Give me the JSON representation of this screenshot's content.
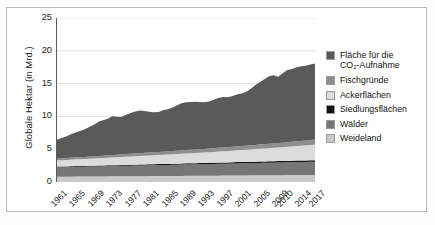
{
  "chart_data": {
    "type": "area",
    "stacked": true,
    "title": "",
    "subtitle": "",
    "xlabel": "",
    "ylabel": "Globale Hektar (in Mrd.)",
    "ylim": [
      0,
      25
    ],
    "ytick_values": [
      0,
      5,
      10,
      15,
      20,
      25
    ],
    "ytick_labels": [
      "0",
      "5",
      "10",
      "15",
      "20",
      "25"
    ],
    "xlim": [
      1961,
      2017
    ],
    "grid": true,
    "grid_axis": "y",
    "legend_position": "right",
    "x_tick_labels": [
      "1961",
      "1965",
      "1969",
      "1973",
      "1977",
      "1981",
      "1985",
      "1989",
      "1993",
      "1997",
      "2001",
      "2005",
      "2009",
      "2010",
      "2014",
      "2017"
    ],
    "x_tick_values": [
      1961,
      1965,
      1969,
      1973,
      1977,
      1981,
      1985,
      1989,
      1993,
      1997,
      2001,
      2005,
      2009,
      2010,
      2014,
      2017
    ],
    "x": [
      1961,
      1962,
      1963,
      1964,
      1965,
      1966,
      1967,
      1968,
      1969,
      1970,
      1971,
      1972,
      1973,
      1974,
      1975,
      1976,
      1977,
      1978,
      1979,
      1980,
      1981,
      1982,
      1983,
      1984,
      1985,
      1986,
      1987,
      1988,
      1989,
      1990,
      1991,
      1992,
      1993,
      1994,
      1995,
      1996,
      1997,
      1998,
      1999,
      2000,
      2001,
      2002,
      2003,
      2004,
      2005,
      2006,
      2007,
      2008,
      2009,
      2010,
      2011,
      2012,
      2013,
      2014,
      2015,
      2016,
      2017
    ],
    "stack_order_bottom_to_top": [
      "Weideland",
      "Wälder",
      "Siedlungsflächen",
      "Ackerflächen",
      "Fischgründe",
      "Fläche für die CO2-Aufnahme"
    ],
    "series": [
      {
        "name": "Fläche für die CO2-Aufnahme",
        "color": "#5a5a5a",
        "values": [
          2.9,
          3.1,
          3.3,
          3.6,
          3.8,
          4.0,
          4.2,
          4.5,
          4.8,
          5.2,
          5.4,
          5.6,
          5.9,
          5.8,
          5.7,
          6.0,
          6.2,
          6.4,
          6.5,
          6.4,
          6.2,
          6.1,
          6.1,
          6.3,
          6.4,
          6.6,
          6.9,
          7.2,
          7.3,
          7.3,
          7.3,
          7.2,
          7.1,
          7.2,
          7.4,
          7.6,
          7.7,
          7.6,
          7.7,
          7.9,
          8.0,
          8.2,
          8.6,
          9.1,
          9.5,
          9.9,
          10.3,
          10.4,
          10.1,
          10.6,
          11.0,
          11.1,
          11.3,
          11.4,
          11.4,
          11.5,
          11.6
        ]
      },
      {
        "name": "Fischgründe",
        "color": "#8e8e8e",
        "values": [
          0.25,
          0.26,
          0.27,
          0.28,
          0.29,
          0.3,
          0.31,
          0.32,
          0.33,
          0.34,
          0.35,
          0.35,
          0.36,
          0.37,
          0.38,
          0.39,
          0.4,
          0.41,
          0.42,
          0.43,
          0.44,
          0.45,
          0.46,
          0.47,
          0.48,
          0.49,
          0.5,
          0.51,
          0.52,
          0.52,
          0.53,
          0.53,
          0.54,
          0.55,
          0.56,
          0.57,
          0.58,
          0.58,
          0.59,
          0.6,
          0.6,
          0.61,
          0.62,
          0.63,
          0.64,
          0.65,
          0.66,
          0.67,
          0.68,
          0.69,
          0.7,
          0.71,
          0.72,
          0.73,
          0.74,
          0.75,
          0.76
        ]
      },
      {
        "name": "Ackerflächen",
        "color": "#dcdcdc",
        "values": [
          0.95,
          0.97,
          0.99,
          1.01,
          1.03,
          1.05,
          1.07,
          1.09,
          1.11,
          1.13,
          1.15,
          1.17,
          1.19,
          1.21,
          1.23,
          1.25,
          1.27,
          1.29,
          1.31,
          1.33,
          1.35,
          1.37,
          1.39,
          1.41,
          1.43,
          1.45,
          1.47,
          1.49,
          1.51,
          1.53,
          1.55,
          1.57,
          1.59,
          1.62,
          1.65,
          1.68,
          1.71,
          1.74,
          1.77,
          1.8,
          1.83,
          1.86,
          1.89,
          1.92,
          1.95,
          1.98,
          2.01,
          2.04,
          2.07,
          2.1,
          2.14,
          2.18,
          2.22,
          2.26,
          2.3,
          2.34,
          2.38
        ]
      },
      {
        "name": "Siedlungsflächen",
        "color": "#141414",
        "values": [
          0.1,
          0.1,
          0.1,
          0.11,
          0.11,
          0.11,
          0.11,
          0.12,
          0.12,
          0.12,
          0.12,
          0.13,
          0.13,
          0.13,
          0.13,
          0.14,
          0.14,
          0.14,
          0.14,
          0.15,
          0.15,
          0.15,
          0.15,
          0.16,
          0.16,
          0.16,
          0.16,
          0.17,
          0.17,
          0.17,
          0.17,
          0.18,
          0.18,
          0.18,
          0.18,
          0.19,
          0.19,
          0.19,
          0.19,
          0.2,
          0.2,
          0.2,
          0.2,
          0.21,
          0.21,
          0.21,
          0.21,
          0.22,
          0.22,
          0.22,
          0.22,
          0.23,
          0.23,
          0.23,
          0.23,
          0.24,
          0.24
        ]
      },
      {
        "name": "Wälder",
        "color": "#767676",
        "values": [
          1.45,
          1.46,
          1.47,
          1.48,
          1.49,
          1.5,
          1.51,
          1.52,
          1.53,
          1.54,
          1.55,
          1.56,
          1.57,
          1.58,
          1.59,
          1.6,
          1.61,
          1.62,
          1.63,
          1.64,
          1.65,
          1.66,
          1.67,
          1.68,
          1.69,
          1.7,
          1.71,
          1.72,
          1.73,
          1.74,
          1.75,
          1.76,
          1.77,
          1.78,
          1.79,
          1.8,
          1.81,
          1.82,
          1.83,
          1.84,
          1.85,
          1.86,
          1.87,
          1.88,
          1.89,
          1.9,
          1.91,
          1.92,
          1.93,
          1.94,
          1.95,
          1.96,
          1.97,
          1.98,
          1.99,
          2.0,
          2.01
        ]
      },
      {
        "name": "Weideland",
        "color": "#c9c9c9",
        "values": [
          0.8,
          0.8,
          0.81,
          0.81,
          0.82,
          0.82,
          0.83,
          0.83,
          0.84,
          0.84,
          0.85,
          0.85,
          0.86,
          0.86,
          0.87,
          0.87,
          0.88,
          0.88,
          0.89,
          0.89,
          0.9,
          0.9,
          0.91,
          0.91,
          0.92,
          0.92,
          0.93,
          0.93,
          0.94,
          0.94,
          0.95,
          0.95,
          0.96,
          0.96,
          0.97,
          0.97,
          0.98,
          0.98,
          0.99,
          0.99,
          1.0,
          1.0,
          1.01,
          1.01,
          1.02,
          1.02,
          1.03,
          1.03,
          1.04,
          1.04,
          1.05,
          1.05,
          1.06,
          1.06,
          1.07,
          1.07,
          1.08
        ]
      }
    ]
  },
  "legend": {
    "items": [
      {
        "label": "Fläche für die\nCO₂-Aufnahme",
        "color": "#5a5a5a",
        "name": "flaeche-co2-aufnahme"
      },
      {
        "label": "Fischgründe",
        "color": "#8e8e8e",
        "name": "fischgruende"
      },
      {
        "label": "Ackerflächen",
        "color": "#dcdcdc",
        "name": "ackerflaechen"
      },
      {
        "label": "Siedlungsflächen",
        "color": "#141414",
        "name": "siedlungsflaechen"
      },
      {
        "label": "Wälder",
        "color": "#767676",
        "name": "waelder"
      },
      {
        "label": "Weideland",
        "color": "#c9c9c9",
        "name": "weideland"
      }
    ]
  },
  "caption": {
    "text": ""
  }
}
